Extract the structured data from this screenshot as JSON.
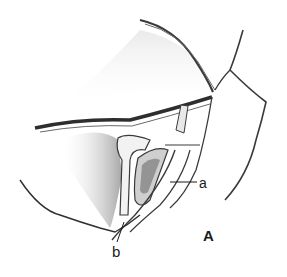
{
  "figure": {
    "panel_label": "A",
    "labels": [
      {
        "id": "a",
        "text": "a"
      },
      {
        "id": "b",
        "text": "b"
      }
    ],
    "colors": {
      "background": "#ffffff",
      "ink": "#2a2a2a",
      "shading": "#8a8a8a"
    }
  }
}
